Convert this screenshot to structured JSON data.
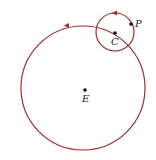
{
  "diagram": {
    "type": "epicycle-orbit",
    "curve_color": "#a52a2a",
    "point_color": "#111111",
    "large_circle": {
      "cx": 83,
      "cy": 88,
      "r": 62,
      "direction": "counterclockwise"
    },
    "small_circle": {
      "cx": 115,
      "cy": 32,
      "r": 19,
      "direction": "counterclockwise"
    },
    "points": [
      {
        "id": "E",
        "label": "E",
        "x": 85,
        "y": 90
      },
      {
        "id": "C",
        "label": "C",
        "x": 115,
        "y": 33
      },
      {
        "id": "P",
        "label": "P",
        "x": 131,
        "y": 24
      }
    ]
  }
}
